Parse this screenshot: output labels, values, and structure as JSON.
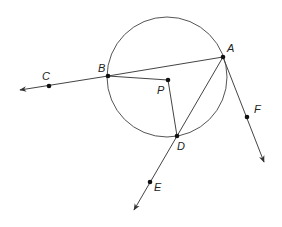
{
  "diagram": {
    "colors": {
      "stroke": "#444444",
      "circle": "#555555",
      "point": "#111111",
      "label": "#222222"
    },
    "circle": {
      "center": "P",
      "cx": 167,
      "cy": 77,
      "r": 60
    },
    "points": [
      {
        "id": "A",
        "label": "A",
        "x": 223,
        "y": 57,
        "lx": 227,
        "ly": 52
      },
      {
        "id": "B",
        "label": "B",
        "x": 108,
        "y": 76,
        "lx": 98,
        "ly": 72
      },
      {
        "id": "C",
        "label": "C",
        "x": 49,
        "y": 86,
        "lx": 42,
        "ly": 80
      },
      {
        "id": "P",
        "label": "P",
        "x": 168,
        "y": 80,
        "lx": 157,
        "ly": 94
      },
      {
        "id": "D",
        "label": "D",
        "x": 177,
        "y": 136,
        "lx": 177,
        "ly": 150
      },
      {
        "id": "E",
        "label": "E",
        "x": 150,
        "y": 182,
        "lx": 154,
        "ly": 191
      },
      {
        "id": "F",
        "label": "F",
        "x": 247,
        "y": 117,
        "lx": 254,
        "ly": 113
      }
    ],
    "segments": [
      {
        "from": "B",
        "to": "A"
      },
      {
        "from": "B",
        "to": "P"
      },
      {
        "from": "P",
        "to": "D"
      }
    ],
    "rays": [
      {
        "from": "B",
        "through": "C",
        "end": [
          20,
          90
        ]
      },
      {
        "from": "A",
        "through": "F",
        "end": [
          264,
          162
        ]
      },
      {
        "from": "A",
        "through": "E",
        "end": [
          134,
          210
        ]
      }
    ]
  }
}
